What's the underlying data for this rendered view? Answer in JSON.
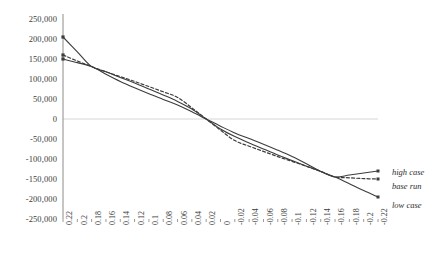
{
  "chart_data": {
    "type": "line",
    "title": "",
    "xlabel": "",
    "ylabel": "",
    "grid": "zero-line-only",
    "legend_position": "right-inline",
    "ylim": [
      -250000,
      250000
    ],
    "ytick_step": 50000,
    "yticks": [
      "250,000",
      "200,000",
      "150,000",
      "100,000",
      "50,000",
      "0",
      "-50,000",
      "-100,000",
      "-150,000",
      "-200,000",
      "-250,000"
    ],
    "xlim": [
      0.22,
      -0.22
    ],
    "x_axis_direction": "descending",
    "xtick_step": 0.02,
    "x": [
      0.22,
      0.2,
      0.18,
      0.16,
      0.14,
      0.12,
      0.1,
      0.08,
      0.06,
      0.04,
      0.02,
      0,
      -0.02,
      -0.04,
      -0.06,
      -0.08,
      -0.1,
      -0.12,
      -0.14,
      -0.16,
      -0.18,
      -0.2,
      -0.22
    ],
    "xticks": [
      "0.22",
      "0.2",
      "0.18",
      "0.16",
      "0.14",
      "0.12",
      "0.1",
      "0.08",
      "0.06",
      "0.04",
      "0.02",
      "0",
      "-0.02",
      "-0.04",
      "-0.06",
      "-0.08",
      "-0.1",
      "-0.12",
      "-0.14",
      "-0.16",
      "-0.18",
      "-0.2",
      "-0.22"
    ],
    "series": [
      {
        "name": "high case",
        "style": "solid",
        "color": "#3c3c3c",
        "values": [
          205000,
          168000,
          131000,
          118000,
          104000,
          90000,
          75000,
          60000,
          44000,
          25000,
          0,
          -25000,
          -44000,
          -60000,
          -75000,
          -90000,
          -104000,
          -118000,
          -131000,
          -145000,
          -140000,
          -135000,
          -130000
        ]
      },
      {
        "name": "base run",
        "style": "dashed",
        "color": "#3c3c3c",
        "values": [
          160000,
          145000,
          131000,
          118000,
          106000,
          94000,
          81000,
          68000,
          54000,
          28000,
          0,
          -28000,
          -54000,
          -68000,
          -81000,
          -94000,
          -106000,
          -118000,
          -131000,
          -145000,
          -147000,
          -149000,
          -150000
        ]
      },
      {
        "name": "low case",
        "style": "solid",
        "color": "#3c3c3c",
        "values": [
          150000,
          141000,
          131000,
          112000,
          94000,
          78000,
          63000,
          49000,
          35000,
          18000,
          0,
          -18000,
          -35000,
          -49000,
          -63000,
          -78000,
          -94000,
          -112000,
          -131000,
          -145000,
          -162000,
          -179000,
          -195000
        ]
      }
    ]
  },
  "legend": {
    "high_case": "high case",
    "base_run": "base run",
    "low_case": "low case"
  }
}
